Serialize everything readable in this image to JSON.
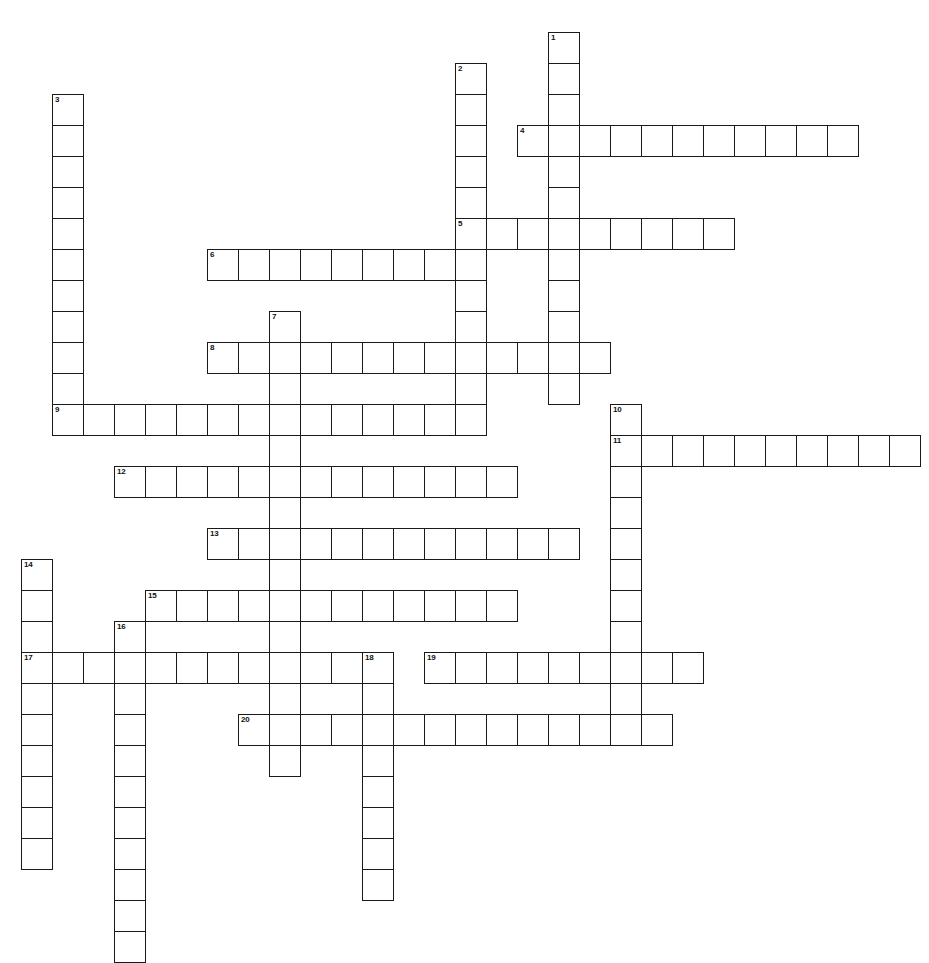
{
  "puzzle": {
    "title": "Crossword Puzzle Grid",
    "cell_size": 31,
    "origin_x": 21,
    "origin_y": 32,
    "grid_cols": 30,
    "grid_rows": 30,
    "line_color": "#1a1a1a",
    "cell_fill": "#ffffff",
    "page_background": "#ffffff",
    "number_count": 20,
    "entries": [
      {
        "number": "1",
        "direction": "down",
        "col": 17,
        "row": 0,
        "length": 12
      },
      {
        "number": "2",
        "direction": "down",
        "col": 14,
        "row": 1,
        "length": 12
      },
      {
        "number": "3",
        "direction": "down",
        "col": 1,
        "row": 2,
        "length": 11
      },
      {
        "number": "4",
        "direction": "across",
        "col": 16,
        "row": 3,
        "length": 11
      },
      {
        "number": "5",
        "direction": "across",
        "col": 14,
        "row": 6,
        "length": 9
      },
      {
        "number": "6",
        "direction": "across",
        "col": 6,
        "row": 7,
        "length": 9
      },
      {
        "number": "7",
        "direction": "down",
        "col": 8,
        "row": 9,
        "length": 15
      },
      {
        "number": "8",
        "direction": "across",
        "col": 6,
        "row": 10,
        "length": 13
      },
      {
        "number": "9",
        "direction": "across",
        "col": 1,
        "row": 12,
        "length": 13
      },
      {
        "number": "10",
        "direction": "down",
        "col": 19,
        "row": 12,
        "length": 11
      },
      {
        "number": "11",
        "direction": "across",
        "col": 19,
        "row": 13,
        "length": 10
      },
      {
        "number": "12",
        "direction": "across",
        "col": 3,
        "row": 14,
        "length": 13
      },
      {
        "number": "13",
        "direction": "across",
        "col": 6,
        "row": 16,
        "length": 12
      },
      {
        "number": "14",
        "direction": "down",
        "col": 0,
        "row": 17,
        "length": 10
      },
      {
        "number": "15",
        "direction": "across",
        "col": 4,
        "row": 18,
        "length": 12
      },
      {
        "number": "16",
        "direction": "down",
        "col": 3,
        "row": 19,
        "length": 11
      },
      {
        "number": "17",
        "direction": "across",
        "col": 0,
        "row": 20,
        "length": 11
      },
      {
        "number": "18",
        "direction": "down",
        "col": 11,
        "row": 20,
        "length": 8
      },
      {
        "number": "19",
        "direction": "across",
        "col": 13,
        "row": 20,
        "length": 9
      },
      {
        "number": "20",
        "direction": "across",
        "col": 7,
        "row": 22,
        "length": 14
      }
    ],
    "numbers_visible": [
      "1",
      "2",
      "3",
      "4",
      "5",
      "6",
      "7",
      "8",
      "9",
      "10",
      "11",
      "12",
      "13",
      "14",
      "15",
      "16",
      "17",
      "18",
      "19",
      "20"
    ],
    "caption": ""
  }
}
